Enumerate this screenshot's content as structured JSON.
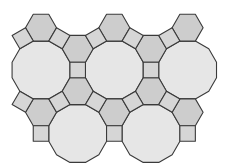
{
  "diagram": {
    "title": "Truncated trihexagonal tiling patch",
    "edge_length": 15.5,
    "colors": {
      "background": "#ffffff",
      "stroke": "#3a3a3a",
      "dodecagon_fill": "#e6e6e6",
      "hexagon_fill": "#cdcdcd",
      "square_fill": "#d6d6d6"
    },
    "dodecagons": [
      {
        "cx": 41.0,
        "cy": 70.0
      },
      {
        "cx": 114.3,
        "cy": 70.0
      },
      {
        "cx": 187.6,
        "cy": 70.0
      },
      {
        "cx": 77.7,
        "cy": 133.5
      },
      {
        "cx": 151.0,
        "cy": 133.5
      }
    ],
    "hexagons": [
      {
        "cx": 41.0,
        "cy": 27.7
      },
      {
        "cx": 114.3,
        "cy": 27.7
      },
      {
        "cx": 187.6,
        "cy": 27.7
      },
      {
        "cx": 77.7,
        "cy": 48.8
      },
      {
        "cx": 151.0,
        "cy": 48.8
      },
      {
        "cx": 77.7,
        "cy": 91.2
      },
      {
        "cx": 151.0,
        "cy": 91.2
      },
      {
        "cx": 41.0,
        "cy": 112.3
      },
      {
        "cx": 114.3,
        "cy": 112.3
      },
      {
        "cx": 187.6,
        "cy": 112.3
      }
    ],
    "squares": [
      {
        "cx": 22.7,
        "cy": 38.25,
        "rot": 60
      },
      {
        "cx": 59.4,
        "cy": 38.25,
        "rot": 30
      },
      {
        "cx": 96.0,
        "cy": 38.25,
        "rot": 60
      },
      {
        "cx": 132.7,
        "cy": 38.25,
        "rot": 30
      },
      {
        "cx": 169.3,
        "cy": 38.25,
        "rot": 60
      },
      {
        "cx": 77.7,
        "cy": 70.0,
        "rot": 0
      },
      {
        "cx": 151.0,
        "cy": 70.0,
        "rot": 0
      },
      {
        "cx": 22.7,
        "cy": 101.75,
        "rot": 30
      },
      {
        "cx": 59.4,
        "cy": 101.75,
        "rot": 60
      },
      {
        "cx": 96.0,
        "cy": 101.75,
        "rot": 30
      },
      {
        "cx": 132.7,
        "cy": 101.75,
        "rot": 60
      },
      {
        "cx": 169.3,
        "cy": 101.75,
        "rot": 30
      },
      {
        "cx": 41.0,
        "cy": 133.5,
        "rot": 0
      },
      {
        "cx": 114.3,
        "cy": 133.5,
        "rot": 0
      },
      {
        "cx": 187.6,
        "cy": 133.5,
        "rot": 0
      }
    ]
  }
}
